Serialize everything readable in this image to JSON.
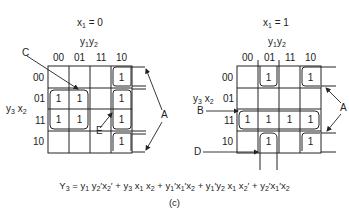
{
  "maps": [
    {
      "id": "left",
      "title": "x1 = 0",
      "title_var": "x",
      "title_sub": "1",
      "title_value": "= 0",
      "col_var_label": [
        "y",
        "1",
        "y",
        "2"
      ],
      "row_var_label": [
        "y",
        "3",
        "x",
        "2"
      ],
      "col_headers": [
        "00",
        "01",
        "11",
        "10"
      ],
      "row_headers": [
        "00",
        "01",
        "11",
        "10"
      ],
      "cells": [
        [
          "",
          "",
          "",
          "1"
        ],
        [
          "1",
          "1",
          "",
          "1"
        ],
        [
          "1",
          "1",
          "",
          "1"
        ],
        [
          "",
          "",
          "",
          "1"
        ]
      ],
      "annotations": [
        "C",
        "E",
        "A"
      ]
    },
    {
      "id": "right",
      "title": "x1 = 1",
      "title_var": "x",
      "title_sub": "1",
      "title_value": "= 1",
      "col_var_label": [
        "y",
        "1",
        "y",
        "2"
      ],
      "row_var_label": [
        "y",
        "3",
        "x",
        "2"
      ],
      "col_headers": [
        "00",
        "01",
        "11",
        "10"
      ],
      "row_headers": [
        "00",
        "01",
        "11",
        "10"
      ],
      "cells": [
        [
          "",
          "1",
          "",
          "1"
        ],
        [
          "",
          "",
          "",
          ""
        ],
        [
          "1",
          "1",
          "1",
          "1"
        ],
        [
          "",
          "1",
          "",
          "1"
        ]
      ],
      "annotations": [
        "B",
        "D",
        "A"
      ]
    }
  ],
  "labels": {
    "C": "C",
    "E": "E",
    "A": "A",
    "B": "B",
    "D": "D"
  },
  "equation": {
    "lhs": "Y",
    "lhs_sub": "3",
    "terms": [
      "y1 y2' x2'",
      "y3 x1 x2",
      "y1' x1' x2",
      "y1' y2 x1 x2'",
      "y2' x1' x2"
    ]
  },
  "caption": "(c)"
}
